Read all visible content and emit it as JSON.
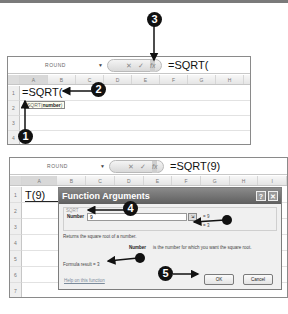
{
  "screenshot1": {
    "name_box": "ROUND",
    "formula_bar_value": "=SQRT(",
    "formula_buttons": {
      "cancel": "✕",
      "enter": "✓",
      "fx": "fx"
    },
    "columns": [
      "A",
      "B",
      "C",
      "D",
      "E",
      "F",
      "G",
      "H"
    ],
    "rows": [
      "1",
      "2",
      "3",
      "4"
    ],
    "cell_A1": "=SQRT(",
    "tooltip_fn": "SQRT(",
    "tooltip_arg": "number",
    "tooltip_close": ")"
  },
  "screenshot2": {
    "name_box": "ROUND",
    "formula_bar_value": "=SQRT(9)",
    "formula_buttons": {
      "cancel": "✕",
      "enter": "✓",
      "fx": "fx"
    },
    "columns": [
      "A",
      "B",
      "C",
      "D",
      "E",
      "F",
      "G",
      "H",
      "I"
    ],
    "rows": [
      "1",
      "2",
      "3",
      "4",
      "5",
      "6",
      "7"
    ],
    "cell_A1": "T(9)",
    "dialog": {
      "title": "Function Arguments",
      "help_button": "?",
      "close_button": "✕",
      "function_name": "SQRT",
      "arg_label": "Number",
      "arg_value": "9",
      "arg_result": "= 9",
      "function_result": "= 3",
      "description": "Returns the square root of a number.",
      "arg_desc_label": "Number",
      "arg_desc": "is the number for which you want the square root.",
      "formula_result": "Formula result =  3",
      "help_link": "Help on this function",
      "ok_label": "OK",
      "cancel_label": "Cancel"
    }
  },
  "callouts": [
    "1",
    "2",
    "3",
    "4",
    "5"
  ]
}
